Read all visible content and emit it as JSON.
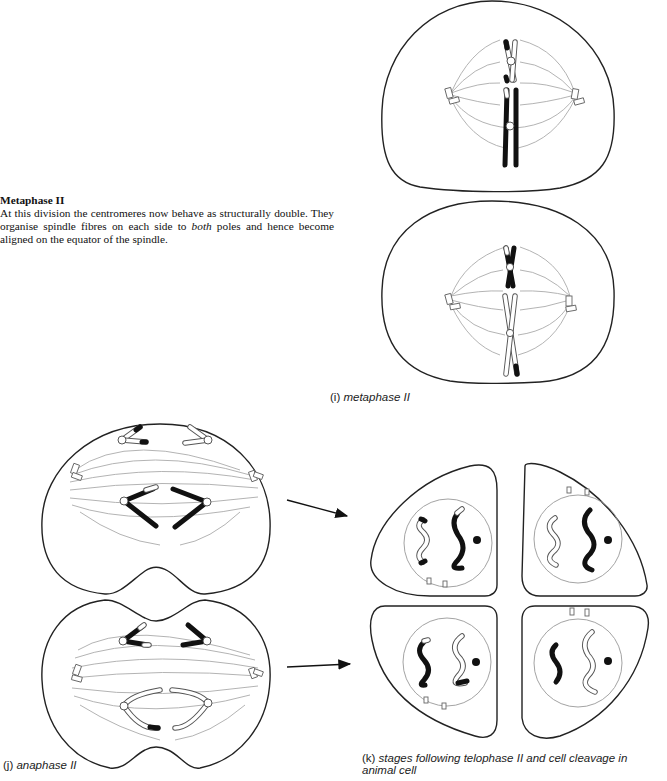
{
  "section": {
    "heading": "Metaphase II",
    "body_part1": "At this division the centromeres now behave as structurally double. They organise spindle fibres on each side to ",
    "body_emphasis": "both",
    "body_part2": " poles and hence become aligned on the equator of the spindle."
  },
  "captions": {
    "i": {
      "label": "(i) ",
      "text": "metaphase II"
    },
    "j": {
      "label": "(j) ",
      "text": "anaphase II"
    },
    "k": {
      "label": "(k) ",
      "text": "stages following telophase II and cell cleavage in animal cell"
    }
  },
  "figures": {
    "i": {
      "name": "metaphase II",
      "cells": 2
    },
    "j": {
      "name": "anaphase II",
      "cells": 2
    },
    "k": {
      "name": "post-telophase II daughter cells",
      "cells": 4
    }
  }
}
